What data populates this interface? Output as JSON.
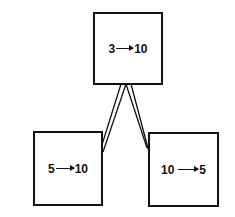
{
  "diagram": {
    "nodes": [
      {
        "id": "top",
        "from": "3",
        "to": "10"
      },
      {
        "id": "left",
        "from": "5",
        "to": "10"
      },
      {
        "id": "right",
        "from": "10",
        "to": "5"
      }
    ],
    "edges": [
      {
        "from": "top",
        "to": "left"
      },
      {
        "from": "top",
        "to": "right"
      }
    ]
  }
}
